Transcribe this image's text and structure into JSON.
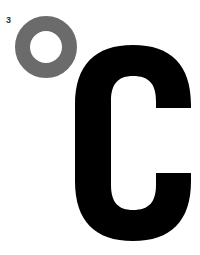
{
  "label_number": "3",
  "symbol": {
    "ring": "degree-ring",
    "letter": "C",
    "meaning": "°C",
    "ring_color": "#6b6b6b",
    "letter_color": "#000000"
  }
}
